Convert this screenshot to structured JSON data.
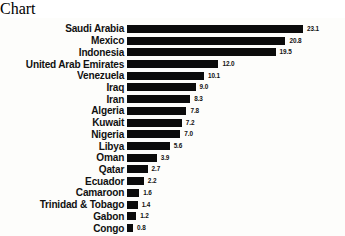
{
  "chart_data": {
    "type": "bar",
    "orientation": "horizontal",
    "title": "",
    "subtitle": "",
    "xlabel": "",
    "ylabel": "",
    "grid": false,
    "legend": false,
    "axis_visible": false,
    "xlim": [
      0,
      23.1
    ],
    "bar_color": "#0b0b0b",
    "background_color": "#fdfdfb",
    "value_label_format": "one-decimal",
    "categories": [
      "Saudi Arabia",
      "Mexico",
      "Indonesia",
      "United Arab Emirates",
      "Venezuela",
      "Iraq",
      "Iran",
      "Algeria",
      "Kuwait",
      "Nigeria",
      "Libya",
      "Oman",
      "Qatar",
      "Ecuador",
      "Camaroon",
      "Trinidad & Tobago",
      "Gabon",
      "Congo"
    ],
    "values": [
      23.1,
      20.8,
      19.5,
      12.0,
      10.1,
      9.0,
      8.3,
      7.8,
      7.2,
      7.0,
      5.6,
      3.9,
      2.7,
      2.2,
      1.6,
      1.4,
      1.2,
      0.8
    ],
    "value_labels": [
      "23.1",
      "20.8",
      "19.5",
      "12.0",
      "10.1",
      "9.0",
      "8.3",
      "7.8",
      "7.2",
      "7.0",
      "5.6",
      "3.9",
      "2.7",
      "2.2",
      "1.6",
      "1.4",
      "1.2",
      "0.8"
    ]
  }
}
